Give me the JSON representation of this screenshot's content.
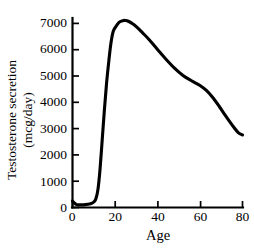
{
  "chart_data": {
    "type": "line",
    "title": "",
    "xlabel": "Age",
    "ylabel_line1": "Testosterone secretion",
    "ylabel_line2": "(mcg/day)",
    "ylabel": "Testosterone secretion (mcg/day)",
    "xlim": [
      0,
      80
    ],
    "ylim": [
      0,
      7400
    ],
    "grid": false,
    "legend": "none",
    "xticks": [
      "0",
      "20",
      "40",
      "60",
      "80"
    ],
    "xtick_values": [
      0,
      20,
      40,
      60,
      80
    ],
    "yticks": [
      "0",
      "1000",
      "2000",
      "3000",
      "4000",
      "5000",
      "6000",
      "7000"
    ],
    "ytick_values": [
      0,
      1000,
      2000,
      3000,
      4000,
      5000,
      6000,
      7000
    ],
    "series": [
      {
        "name": "Testosterone secretion",
        "color": "#000000",
        "x": [
          0,
          1,
          2,
          3,
          4,
          6,
          8,
          9,
          10,
          11,
          12,
          13,
          14,
          15,
          16,
          17,
          18,
          19,
          20,
          22,
          24,
          25,
          26,
          28,
          30,
          33,
          36,
          40,
          44,
          48,
          52,
          56,
          60,
          63,
          66,
          69,
          72,
          75,
          78,
          80
        ],
        "y": [
          250,
          160,
          110,
          100,
          100,
          110,
          130,
          160,
          210,
          330,
          700,
          1500,
          2600,
          3700,
          4700,
          5500,
          6200,
          6650,
          6830,
          7050,
          7110,
          7110,
          7090,
          7000,
          6880,
          6640,
          6390,
          6010,
          5640,
          5300,
          5020,
          4820,
          4640,
          4450,
          4180,
          3850,
          3490,
          3150,
          2850,
          2760
        ]
      }
    ],
    "peak": {
      "age": 25,
      "value": 7110
    },
    "endpoint": {
      "age": 80,
      "value": 2760
    }
  }
}
